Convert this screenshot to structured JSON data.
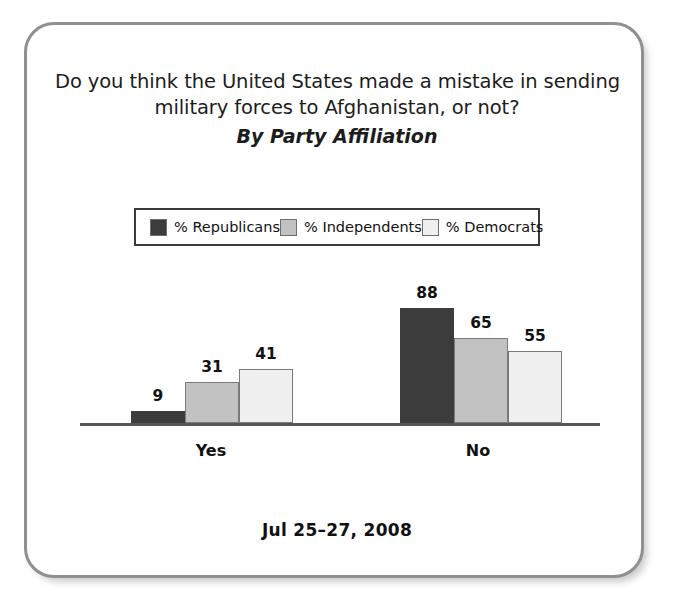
{
  "card": {
    "title_line1": "Do you think the United States made a mistake in sending",
    "title_line2": "military forces to Afghanistan, or not?",
    "subtitle": "By Party Affiliation",
    "footer_date": "Jul 25–27, 2008"
  },
  "legend": {
    "items": [
      {
        "label": "% Republicans",
        "color": "#3c3c3c"
      },
      {
        "label": "% Independents",
        "color": "#c2c2c2"
      },
      {
        "label": "% Democrats",
        "color": "#f0f0f0"
      }
    ]
  },
  "chart_data": {
    "type": "bar",
    "title": "Do you think the United States made a mistake in sending military forces to Afghanistan, or not?",
    "subtitle": "By Party Affiliation",
    "xlabel": "",
    "ylabel": "",
    "ylim": [
      0,
      100
    ],
    "grid": false,
    "legend_position": "top",
    "categories": [
      "Yes",
      "No"
    ],
    "series": [
      {
        "name": "% Republicans",
        "color": "#3c3c3c",
        "values": [
          9,
          88
        ]
      },
      {
        "name": "% Independents",
        "color": "#c2c2c2",
        "values": [
          31,
          65
        ]
      },
      {
        "name": "% Democrats",
        "color": "#f0f0f0",
        "values": [
          41,
          55
        ]
      }
    ],
    "annotations": [
      "Jul 25–27, 2008"
    ]
  }
}
